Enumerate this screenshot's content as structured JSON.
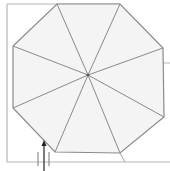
{
  "diagram": {
    "width": 170,
    "height": 171,
    "background": "#ffffff",
    "fill": "#f4f4f4",
    "stroke": "#8a8a8a",
    "frame_stroke": "#b5b5b5",
    "center": [
      88,
      75
    ],
    "octagon": [
      [
        57,
        4
      ],
      [
        120,
        4
      ],
      [
        163,
        48
      ],
      [
        164,
        117
      ],
      [
        120,
        153
      ],
      [
        55,
        152
      ],
      [
        13,
        108
      ],
      [
        13,
        46
      ]
    ],
    "frame_lines": [
      [
        [
          7,
          4
        ],
        [
          120,
          4
        ]
      ],
      [
        [
          7,
          4
        ],
        [
          7,
          162
        ]
      ],
      [
        [
          7,
          162
        ],
        [
          170,
          162
        ]
      ],
      [
        [
          107,
          8
        ],
        [
          107,
          63
        ]
      ],
      [
        [
          107,
          63
        ],
        [
          170,
          63
        ]
      ],
      [
        [
          120,
          153
        ],
        [
          125,
          162
        ]
      ]
    ],
    "arrow": {
      "x": 44,
      "y_start": 171,
      "y_end": 142,
      "head": 5,
      "color": "#222222"
    },
    "ticks": [
      [
        [
          38,
          152
        ],
        [
          38,
          166
        ]
      ],
      [
        [
          49,
          152
        ],
        [
          49,
          166
        ]
      ]
    ]
  }
}
